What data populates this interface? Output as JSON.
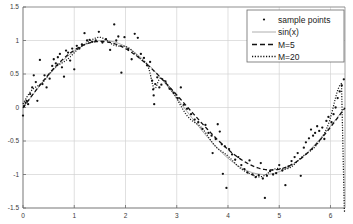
{
  "chart_data": {
    "type": "scatter",
    "title": "",
    "xlabel": "",
    "ylabel": "",
    "xlim": [
      0,
      6.2832
    ],
    "ylim": [
      -1.5,
      1.5
    ],
    "grid": true,
    "legend_position": "top-right",
    "xticks": [
      "0",
      "1",
      "2",
      "3",
      "4",
      "5",
      "6"
    ],
    "xtick_values": [
      0,
      1,
      2,
      3,
      4,
      5,
      6
    ],
    "yticks": [
      "1.5",
      "1",
      "0.5",
      "0",
      "-0.5",
      "-1",
      "-1.5"
    ],
    "ytick_values": [
      1.5,
      1,
      0.5,
      0,
      -0.5,
      -1,
      -1.5
    ],
    "legend": [
      {
        "label": "sample points",
        "marker": "dot",
        "color": "#111111"
      },
      {
        "label": "sin(x)",
        "marker": "solid-line",
        "color": "#888888"
      },
      {
        "label": "M=5",
        "marker": "dashed-line",
        "color": "#111111"
      },
      {
        "label": "M=20",
        "marker": "dotted-line",
        "color": "#111111"
      }
    ],
    "series": [
      {
        "name": "sample points",
        "type": "scatter",
        "points": [
          [
            0.0,
            -0.12
          ],
          [
            0.02,
            0.02
          ],
          [
            0.05,
            0.07
          ],
          [
            0.07,
            0.1
          ],
          [
            0.1,
            0.05
          ],
          [
            0.14,
            0.2
          ],
          [
            0.18,
            0.3
          ],
          [
            0.21,
            0.48
          ],
          [
            0.25,
            0.38
          ],
          [
            0.28,
            0.1
          ],
          [
            0.33,
            0.71
          ],
          [
            0.38,
            0.35
          ],
          [
            0.42,
            0.48
          ],
          [
            0.46,
            0.3
          ],
          [
            0.52,
            0.43
          ],
          [
            0.57,
            0.62
          ],
          [
            0.6,
            0.72
          ],
          [
            0.64,
            0.66
          ],
          [
            0.68,
            0.75
          ],
          [
            0.72,
            0.8
          ],
          [
            0.76,
            0.6
          ],
          [
            0.8,
            0.46
          ],
          [
            0.84,
            0.85
          ],
          [
            0.88,
            0.82
          ],
          [
            0.92,
            0.7
          ],
          [
            0.96,
            0.88
          ],
          [
            1.0,
            0.57
          ],
          [
            1.05,
            0.92
          ],
          [
            1.1,
            0.88
          ],
          [
            1.15,
            0.94
          ],
          [
            1.2,
            1.11
          ],
          [
            1.25,
            1.0
          ],
          [
            1.3,
            1.01
          ],
          [
            1.35,
            0.98
          ],
          [
            1.42,
            1.0
          ],
          [
            1.48,
            1.13
          ],
          [
            1.55,
            0.97
          ],
          [
            1.62,
            1.02
          ],
          [
            1.7,
            0.86
          ],
          [
            1.78,
            1.24
          ],
          [
            1.82,
            1.0
          ],
          [
            1.86,
            1.06
          ],
          [
            1.92,
            0.52
          ],
          [
            1.98,
            1.05
          ],
          [
            2.05,
            0.87
          ],
          [
            2.12,
            0.72
          ],
          [
            2.18,
            1.1
          ],
          [
            2.24,
            1.04
          ],
          [
            2.3,
            0.8
          ],
          [
            2.36,
            0.74
          ],
          [
            2.42,
            0.63
          ],
          [
            2.48,
            0.68
          ],
          [
            2.52,
            0.4
          ],
          [
            2.54,
            0.27
          ],
          [
            2.55,
            0.18
          ],
          [
            2.56,
            0.05
          ],
          [
            2.58,
            0.35
          ],
          [
            2.62,
            0.45
          ],
          [
            2.66,
            0.3
          ],
          [
            2.7,
            0.34
          ],
          [
            2.78,
            0.39
          ],
          [
            2.86,
            0.28
          ],
          [
            2.94,
            0.22
          ],
          [
            3.02,
            0.14
          ],
          [
            3.08,
            0.3
          ],
          [
            3.14,
            0.04
          ],
          [
            3.2,
            -0.02
          ],
          [
            3.28,
            -0.1
          ],
          [
            3.35,
            -0.18
          ],
          [
            3.42,
            -0.22
          ],
          [
            3.5,
            -0.32
          ],
          [
            3.56,
            -0.26
          ],
          [
            3.62,
            -0.38
          ],
          [
            3.68,
            -0.42
          ],
          [
            3.7,
            -0.68
          ],
          [
            3.76,
            -0.47
          ],
          [
            3.8,
            -0.25
          ],
          [
            3.84,
            -0.36
          ],
          [
            3.88,
            -0.55
          ],
          [
            3.9,
            -0.99
          ],
          [
            3.94,
            -0.58
          ],
          [
            3.97,
            -1.2
          ],
          [
            4.02,
            -0.62
          ],
          [
            4.08,
            -0.7
          ],
          [
            4.14,
            -0.78
          ],
          [
            4.2,
            -0.74
          ],
          [
            4.26,
            -0.86
          ],
          [
            4.32,
            -0.92
          ],
          [
            4.38,
            -0.97
          ],
          [
            4.42,
            -0.79
          ],
          [
            4.48,
            -1.0
          ],
          [
            4.54,
            -1.04
          ],
          [
            4.6,
            -1.01
          ],
          [
            4.64,
            -0.83
          ],
          [
            4.68,
            -1.06
          ],
          [
            4.72,
            -1.35
          ],
          [
            4.76,
            -1.02
          ],
          [
            4.82,
            -0.95
          ],
          [
            4.88,
            -1.0
          ],
          [
            4.94,
            -0.98
          ],
          [
            5.0,
            -0.86
          ],
          [
            5.06,
            -0.94
          ],
          [
            5.12,
            -1.16
          ],
          [
            5.18,
            -0.88
          ],
          [
            5.24,
            -0.8
          ],
          [
            5.3,
            -0.74
          ],
          [
            5.36,
            -0.68
          ],
          [
            5.42,
            -1.02
          ],
          [
            5.48,
            -0.6
          ],
          [
            5.52,
            -0.52
          ],
          [
            5.58,
            -0.46
          ],
          [
            5.62,
            -0.33
          ],
          [
            5.66,
            -0.42
          ],
          [
            5.7,
            -0.38
          ],
          [
            5.74,
            -0.28
          ],
          [
            5.78,
            -0.35
          ],
          [
            5.84,
            -0.3
          ],
          [
            5.88,
            -0.47
          ],
          [
            5.92,
            -0.2
          ],
          [
            5.96,
            -0.14
          ],
          [
            6.02,
            -0.22
          ],
          [
            6.06,
            -0.1
          ],
          [
            6.1,
            0.0
          ],
          [
            6.14,
            0.14
          ],
          [
            6.18,
            0.24
          ],
          [
            6.22,
            0.33
          ],
          [
            6.26,
            0.42
          ]
        ]
      },
      {
        "name": "sin(x)",
        "type": "line",
        "style": "solid",
        "color": "#9a9a9a"
      },
      {
        "name": "M=5",
        "type": "line",
        "style": "dashed",
        "color": "#111111"
      },
      {
        "name": "M=20",
        "type": "line",
        "style": "dotted",
        "color": "#111111"
      }
    ]
  },
  "style": {
    "axis_color": "#6a6a6a",
    "grid_color": "#d2d2d2",
    "background": "#ffffff",
    "point_color": "#111111",
    "legend_border": "#6a6a6a"
  }
}
